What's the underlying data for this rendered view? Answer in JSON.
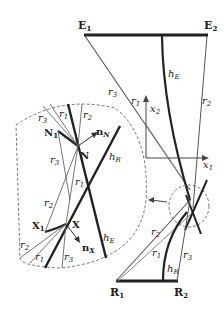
{
  "diagram": {
    "title": "",
    "colors": {
      "stroke": "#222222",
      "thin": "#555555",
      "dash": "#777777",
      "background": "#ffffff"
    },
    "labels": {
      "E1": "E",
      "E1_sub": "1",
      "E2": "E",
      "E2_sub": "2",
      "R1": "R",
      "R1_sub": "1",
      "R2": "R",
      "R2_sub": "2",
      "N": "N",
      "N1": "N",
      "N1_sub": "1",
      "X": "X",
      "X1": "X",
      "X1_sub": "1",
      "nN": "n",
      "nN_sub": "N",
      "nX": "n",
      "nX_sub": "X",
      "hE": "h",
      "hE_sub": "E",
      "hR": "h",
      "hR_sub": "R",
      "x1": "x",
      "x1_sub": "1",
      "x2": "x",
      "x2_sub": "2",
      "r1": "r",
      "r1_sub": "1",
      "r2": "r",
      "r2_sub": "2",
      "r3": "r",
      "r3_sub": "3"
    }
  }
}
